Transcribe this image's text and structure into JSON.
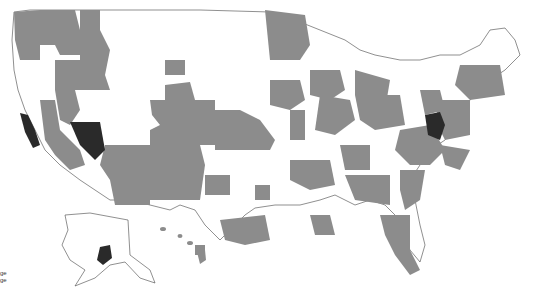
{
  "map": {
    "type": "choropleth",
    "region": "United States (county-level shading)",
    "colors": {
      "background": "#ffffff",
      "none": "#ffffff",
      "medium": "#8c8c8c",
      "high": "#2a2a2a",
      "border": "#3a3a3a"
    }
  },
  "legend": {
    "items": [
      {
        "label": "ge",
        "color": "#8c8c8c"
      },
      {
        "label": "ge",
        "color": "#2a2a2a"
      }
    ]
  }
}
